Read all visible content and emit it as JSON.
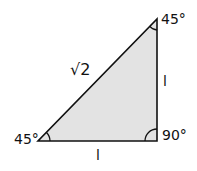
{
  "diagram": {
    "fill_color": "#e3e3e3",
    "stroke_color": "#111111",
    "vertices": {
      "bottom_left": {
        "angle": "45°"
      },
      "top": {
        "angle": "45°"
      },
      "bottom_right": {
        "angle": "90°"
      }
    },
    "sides": {
      "hypotenuse": "√2",
      "vertical": "l",
      "base": "l"
    }
  }
}
